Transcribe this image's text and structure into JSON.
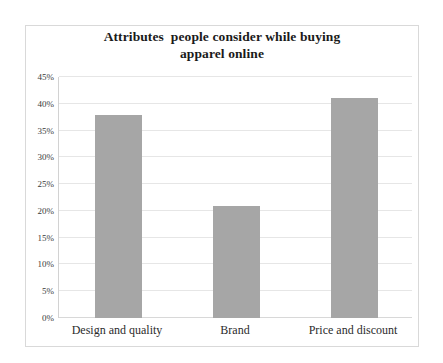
{
  "chart_data": {
    "type": "bar",
    "title_line1": "Attributes  people consider while buying",
    "title_line2": "apparel online",
    "categories": [
      "Design and quality",
      "Brand",
      "Price and discount"
    ],
    "values": [
      38,
      21,
      41
    ],
    "value_labels": [
      "38%",
      "21%",
      "41%"
    ],
    "xlabel": "",
    "ylabel": "",
    "ylim": [
      0,
      45
    ],
    "ytick_values": [
      0,
      5,
      10,
      15,
      20,
      25,
      30,
      35,
      40,
      45
    ],
    "ytick_labels": [
      "0%",
      "5%",
      "10%",
      "15%",
      "20%",
      "25%",
      "30%",
      "35%",
      "40%",
      "45%"
    ],
    "grid": true,
    "legend": false,
    "legend_position": "none",
    "series": [
      {
        "name": "Attributes",
        "values": [
          38,
          21,
          41
        ]
      }
    ],
    "colors": {
      "bar": "#a6a6a6",
      "gridline": "#e6e6e6",
      "axis": "#d2d2d2",
      "frame_border": "#d9d9d9",
      "title_text": "#1a1a1a",
      "tick_text": "#3a3a3a",
      "category_text": "#2b2b2b",
      "background": "#ffffff"
    }
  }
}
